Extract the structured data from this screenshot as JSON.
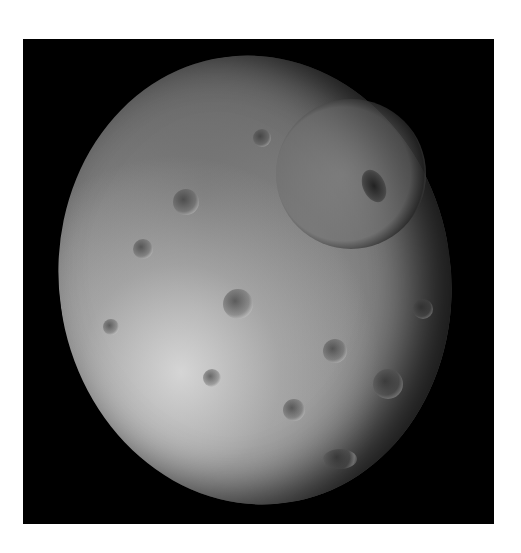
{
  "image": {
    "subject": "Cratered moon with large impact crater",
    "description": "Grayscale spacecraft photograph of a heavily cratered icy moon on a black background, with a large crater featuring a central peak in the upper right.",
    "colors": {
      "background": "#ffffff",
      "space": "#000000",
      "surface_light": "#d0d0d0",
      "surface_mid": "#8c8c8c",
      "surface_dark": "#3a3a3a"
    }
  }
}
